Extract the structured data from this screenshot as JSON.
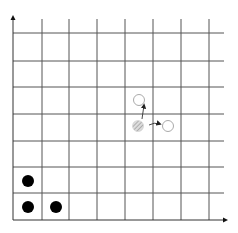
{
  "diagram": {
    "type": "grid-board",
    "grid": {
      "columns": 8,
      "rows": 7,
      "vertical_lines_x": [
        13,
        42,
        69,
        97,
        125,
        153,
        181,
        209
      ],
      "horizontal_lines_y": [
        33,
        61,
        87,
        114,
        141,
        167,
        193
      ],
      "x_extent": [
        13,
        224
      ],
      "y_extent": [
        19,
        220
      ],
      "line_color": "#555555",
      "axis_color": "#333333"
    },
    "axes": {
      "x_axis": {
        "y": 220,
        "x_start": 13,
        "x_end": 228,
        "arrow": "right"
      },
      "y_axis": {
        "x": 13,
        "y_start": 220,
        "y_end": 15,
        "arrow": "up"
      }
    },
    "pieces": {
      "black_dots": [
        {
          "x": 28,
          "y": 181,
          "color": "#000000"
        },
        {
          "x": 28,
          "y": 207,
          "color": "#000000"
        },
        {
          "x": 56,
          "y": 207,
          "color": "#000000"
        }
      ],
      "hatched_piece": {
        "x": 138,
        "y": 126,
        "color": "#bbbbbb"
      },
      "hollow_circles": [
        {
          "x": 139,
          "y": 100,
          "label": "move-up-target"
        },
        {
          "x": 168,
          "y": 126,
          "label": "move-right-target"
        }
      ]
    },
    "move_arrows": [
      {
        "from": [
          141,
          118
        ],
        "to": [
          143,
          106
        ],
        "direction": "up"
      },
      {
        "from": [
          150,
          125
        ],
        "to": [
          160,
          125
        ],
        "direction": "right"
      }
    ]
  }
}
